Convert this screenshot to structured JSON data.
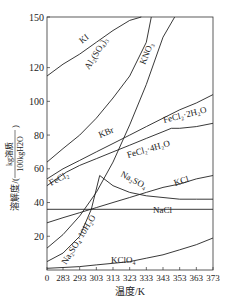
{
  "chart_data": {
    "type": "line",
    "title": "",
    "xlabel": "温度/K",
    "ylabel": "溶解度/(kg溶质/100kgH2O)",
    "ylabel_parts": {
      "prefix": "溶解度/(",
      "numerator": "kg溶质",
      "denominator": "100kgH2O",
      "suffix": ")"
    },
    "xticks": [
      "0",
      "283",
      "293",
      "303",
      "313",
      "323",
      "333",
      "343",
      "353",
      "363",
      "373"
    ],
    "yticks": [
      "20",
      "40",
      "60",
      "80",
      "100",
      "120",
      "150"
    ],
    "xlim": [
      273,
      373
    ],
    "ylim": [
      0,
      150
    ],
    "grid": false,
    "legend": "inline labels",
    "series": [
      {
        "name": "KI",
        "label": "KI",
        "x": [
          273,
          283,
          293,
          303,
          313,
          323,
          330
        ],
        "values": [
          115,
          122,
          128,
          135,
          142,
          148,
          150
        ]
      },
      {
        "name": "Al2(SO4)3",
        "label": "Al₂(SO₄)₃",
        "x": [
          273,
          283,
          293,
          303,
          313,
          323,
          333,
          336
        ],
        "values": [
          64,
          72,
          80,
          90,
          102,
          115,
          135,
          150
        ]
      },
      {
        "name": "KNO3",
        "label": "KNO₃",
        "x": [
          273,
          283,
          293,
          303,
          313,
          323,
          333,
          343,
          350
        ],
        "values": [
          13,
          21,
          32,
          46,
          64,
          86,
          110,
          138,
          150
        ]
      },
      {
        "name": "KBr",
        "label": "KBr",
        "x": [
          273,
          283,
          293,
          303,
          313,
          323,
          333,
          343,
          353,
          363,
          373
        ],
        "values": [
          54,
          60,
          65,
          70,
          75,
          80,
          85,
          90,
          95,
          99,
          104
        ]
      },
      {
        "name": "FeCl2·2H2O",
        "label": "FeCl₂·2H₂O",
        "x": [
          348,
          353,
          363,
          373
        ],
        "values": [
          84,
          84,
          85,
          87
        ]
      },
      {
        "name": "FeCl2·4H2O",
        "label": "FeCl₂·4H₂O",
        "x": [
          285,
          293,
          303,
          313,
          323,
          333,
          343,
          348
        ],
        "values": [
          58,
          62,
          66,
          70,
          74,
          78,
          82,
          84
        ]
      },
      {
        "name": "FeCl2",
        "label": "FeCl₂",
        "x": [
          273,
          279,
          285
        ],
        "values": [
          50,
          54,
          58
        ]
      },
      {
        "name": "Na2SO4",
        "label": "Na₂SO₄",
        "x": [
          305,
          313,
          323,
          333,
          343,
          353,
          363,
          373
        ],
        "values": [
          56,
          50,
          46,
          44,
          43,
          42,
          42,
          42
        ]
      },
      {
        "name": "Na2SO4·10H2O",
        "label": "Na₂SO₄·10H₂O",
        "x": [
          273,
          283,
          293,
          300,
          305
        ],
        "values": [
          5,
          10,
          20,
          36,
          56
        ]
      },
      {
        "name": "KCl",
        "label": "KCl",
        "x": [
          273,
          283,
          293,
          303,
          313,
          323,
          333,
          343,
          353,
          363,
          373
        ],
        "values": [
          28,
          31,
          34,
          37,
          40,
          43,
          46,
          49,
          51,
          54,
          56
        ]
      },
      {
        "name": "NaCl",
        "label": "NaCl",
        "x": [
          273,
          373
        ],
        "values": [
          36,
          36
        ]
      },
      {
        "name": "KClO4",
        "label": "KClO₄",
        "x": [
          273,
          283,
          293,
          303,
          313,
          323,
          333,
          343,
          353,
          363,
          373
        ],
        "values": [
          1,
          1.5,
          2,
          3,
          4,
          5,
          7,
          9,
          12,
          15,
          19
        ]
      }
    ]
  }
}
